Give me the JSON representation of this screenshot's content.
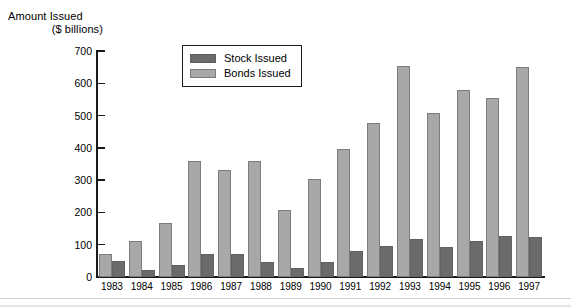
{
  "title": {
    "line1": "Amount Issued",
    "line2": "($ billions)"
  },
  "legend": {
    "items": [
      {
        "label": "Stock Issued",
        "color": "#6b6b6b",
        "key": "stock"
      },
      {
        "label": "Bonds Issued",
        "color": "#a8a8a8",
        "key": "bonds"
      }
    ]
  },
  "axis": {
    "y_ticks": [
      "0",
      "100",
      "200",
      "300",
      "400",
      "500",
      "600",
      "700"
    ],
    "y_min": 0,
    "y_max": 700,
    "y_step": 100
  },
  "colors": {
    "stock": "#6b6b6b",
    "bonds": "#a8a8a8",
    "axis": "#1a1a1a",
    "background": "#ffffff"
  },
  "chart_data": {
    "type": "bar",
    "title": "Amount Issued ($ billions)",
    "xlabel": "",
    "ylabel": "Amount Issued ($ billions)",
    "ylim": [
      0,
      700
    ],
    "ytick_step": 100,
    "grid": false,
    "legend_position": "upper-center",
    "categories": [
      "1983",
      "1984",
      "1985",
      "1986",
      "1987",
      "1988",
      "1989",
      "1990",
      "1991",
      "1992",
      "1993",
      "1994",
      "1995",
      "1996",
      "1997"
    ],
    "series": [
      {
        "name": "Bonds Issued",
        "color": "#a8a8a8",
        "values": [
          70,
          112,
          167,
          358,
          330,
          358,
          207,
          305,
          397,
          478,
          655,
          508,
          578,
          555,
          650
        ]
      },
      {
        "name": "Stock Issued",
        "color": "#6b6b6b",
        "values": [
          50,
          22,
          38,
          72,
          70,
          45,
          28,
          45,
          80,
          95,
          118,
          92,
          112,
          127,
          125
        ]
      }
    ]
  }
}
